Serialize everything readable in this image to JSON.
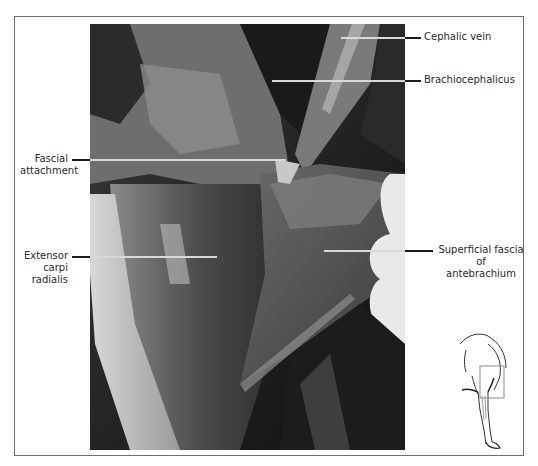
{
  "figure": {
    "type": "anatomical photograph with labels",
    "photo_description": "Dissection of equine forelimb, lateral view of antebrachium, grayscale",
    "labels": [
      {
        "id": "cephalic-vein",
        "text": "Cephalic vein",
        "side": "right"
      },
      {
        "id": "brachiocephalicus",
        "text": "Brachiocephalicus",
        "side": "right"
      },
      {
        "id": "fascial-attachment",
        "line1": "Fascial",
        "line2": "attachment",
        "side": "left"
      },
      {
        "id": "extensor-carpi-radialis",
        "line1": "Extensor",
        "line2": "carpi radialis",
        "side": "left"
      },
      {
        "id": "superficial-fascia",
        "line1": "Superficial fascia of",
        "line2": "antebrachium",
        "side": "right"
      }
    ],
    "inset": {
      "description": "Orientation line drawing of horse forelimb with highlighted box over elbow/forearm region",
      "box_color": "#8a8a8a"
    }
  }
}
